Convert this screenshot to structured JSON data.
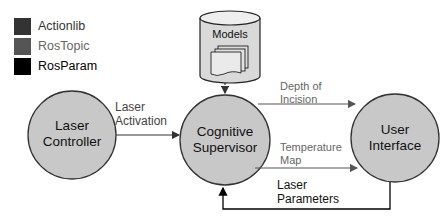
{
  "legend": {
    "items": [
      {
        "label": "Actionlib",
        "swatch_color": "#333333",
        "text_color": "#333333"
      },
      {
        "label": "RosTopic",
        "swatch_color": "#555555",
        "text_color": "#555555"
      },
      {
        "label": "RosParam",
        "swatch_color": "#000000",
        "text_color": "#000000"
      }
    ]
  },
  "database": {
    "label": "Models"
  },
  "nodes": {
    "laser_controller": {
      "line1": "Laser",
      "line2": "Controller"
    },
    "cognitive_supervisor": {
      "line1": "Cognitive",
      "line2": "Supervisor"
    },
    "user_interface": {
      "line1": "User",
      "line2": "Interface"
    }
  },
  "edges": {
    "laser_activation": {
      "line1": "Laser",
      "line2": "Activation",
      "type": "Actionlib"
    },
    "depth_of_incision": {
      "line1": "Depth of",
      "line2": "Incision",
      "type": "RosTopic"
    },
    "temperature_map": {
      "line1": "Temperature",
      "line2": "Map",
      "type": "RosTopic"
    },
    "laser_parameters": {
      "line1": "Laser",
      "line2": "Parameters",
      "type": "RosParam"
    }
  },
  "colors": {
    "node_fill": "#c8c8c8",
    "node_stroke": "#333333",
    "actionlib": "#333333",
    "rostopic": "#666666",
    "rosparam": "#000000"
  }
}
